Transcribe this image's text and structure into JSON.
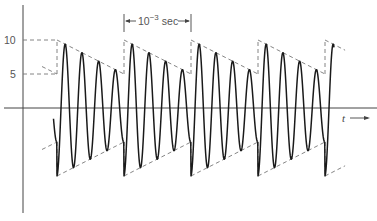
{
  "figure": {
    "type": "amplitude-modulated sinusoid (sawtooth envelope)",
    "y_axis": {
      "ticks": [
        {
          "value": 10,
          "label": "10"
        },
        {
          "value": 5,
          "label": "5"
        }
      ]
    },
    "x_axis": {
      "label": "t",
      "arrow": "right"
    },
    "period_annotation": {
      "base": "10",
      "exponent": "−3",
      "unit": "sec"
    },
    "signal": {
      "envelope_max": 10,
      "envelope_min": 5,
      "envelope_shape": "sawtooth (linear decay from 10 to 5, then reset)",
      "cycles_per_period": 4,
      "periods_shown": 4,
      "period_seconds": 0.001
    },
    "colors": {
      "wave": "#1a1a1a",
      "envelope": "#777777",
      "axis": "#444444"
    }
  }
}
